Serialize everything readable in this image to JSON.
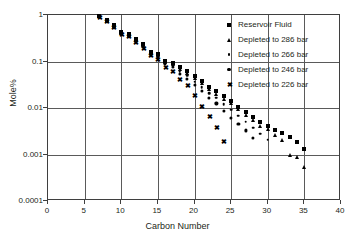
{
  "chart_data": {
    "type": "scatter",
    "title": "",
    "xlabel": "Carbon Number",
    "ylabel": "Mole%",
    "xlim": [
      0,
      40
    ],
    "ylim": [
      0.0001,
      1
    ],
    "yscale": "log",
    "grid": true,
    "legend_position": "top-right",
    "xticks": [
      "0",
      "5",
      "10",
      "15",
      "20",
      "25",
      "30",
      "35",
      "40"
    ],
    "xtick_values": [
      0,
      5,
      10,
      15,
      20,
      25,
      30,
      35,
      40
    ],
    "yticks": [
      "0.0001",
      "0.001",
      "0.01",
      "0.1",
      "1"
    ],
    "ytick_values": [
      0.0001,
      0.001,
      0.01,
      0.1,
      1
    ],
    "series": [
      {
        "name": "Reservoir Fluid",
        "marker": "square",
        "x": [
          7,
          8,
          9,
          10,
          11,
          12,
          13,
          14,
          15,
          16,
          17,
          18,
          19,
          20,
          21,
          22,
          23,
          24,
          25,
          26,
          27,
          28,
          29,
          30,
          31,
          32,
          33,
          34,
          35
        ],
        "y": [
          0.95,
          0.78,
          0.6,
          0.44,
          0.4,
          0.3,
          0.24,
          0.16,
          0.145,
          0.105,
          0.095,
          0.075,
          0.062,
          0.048,
          0.038,
          0.028,
          0.023,
          0.018,
          0.014,
          0.0105,
          0.0082,
          0.0063,
          0.005,
          0.0042,
          0.0034,
          0.0029,
          0.0024,
          0.0019,
          0.0013
        ]
      },
      {
        "name": "Depleted to 286 bar",
        "marker": "triangle",
        "x": [
          7,
          8,
          9,
          10,
          11,
          12,
          13,
          14,
          15,
          16,
          17,
          18,
          19,
          20,
          21,
          22,
          23,
          24,
          25,
          26,
          27,
          28,
          29,
          30,
          31,
          32,
          33,
          34,
          35
        ],
        "y": [
          0.94,
          0.76,
          0.58,
          0.42,
          0.38,
          0.285,
          0.23,
          0.152,
          0.138,
          0.1,
          0.09,
          0.07,
          0.057,
          0.044,
          0.034,
          0.025,
          0.0205,
          0.0155,
          0.0125,
          0.0093,
          0.0072,
          0.0055,
          0.0042,
          0.0035,
          0.0026,
          0.0021,
          0.00098,
          0.00087,
          0.00053
        ]
      },
      {
        "name": "Depleted to 266 bar",
        "marker": "small-dot",
        "x": [
          7,
          8,
          9,
          10,
          11,
          12,
          13,
          14,
          15,
          16,
          17,
          18,
          19,
          20,
          21,
          22,
          23,
          24,
          25,
          26,
          27,
          28,
          29,
          30
        ],
        "y": [
          0.93,
          0.75,
          0.57,
          0.41,
          0.37,
          0.275,
          0.22,
          0.145,
          0.13,
          0.094,
          0.082,
          0.062,
          0.05,
          0.037,
          0.028,
          0.021,
          0.0165,
          0.0122,
          0.0092,
          0.0068,
          0.0051,
          0.0038,
          0.0028,
          0.0021
        ]
      },
      {
        "name": "Depleted to 246 bar",
        "marker": "dot",
        "x": [
          7,
          8,
          9,
          10,
          11,
          12,
          13,
          14,
          15,
          16,
          17,
          18,
          19,
          20,
          21,
          22,
          23,
          24,
          25,
          26,
          27,
          28
        ],
        "y": [
          0.92,
          0.74,
          0.56,
          0.4,
          0.36,
          0.27,
          0.21,
          0.14,
          0.125,
          0.088,
          0.075,
          0.055,
          0.043,
          0.031,
          0.023,
          0.0165,
          0.0125,
          0.0088,
          0.0062,
          0.0045,
          0.0033,
          0.0023
        ]
      },
      {
        "name": "Depleted to 226 bar",
        "marker": "cross",
        "x": [
          7,
          8,
          9,
          10,
          11,
          12,
          13,
          14,
          15,
          16,
          17,
          18,
          19,
          20,
          21,
          22,
          23,
          24
        ],
        "y": [
          0.91,
          0.73,
          0.55,
          0.39,
          0.35,
          0.26,
          0.2,
          0.135,
          0.115,
          0.078,
          0.063,
          0.043,
          0.031,
          0.019,
          0.0112,
          0.0068,
          0.0039,
          0.002
        ]
      }
    ]
  },
  "legend": {
    "items": [
      {
        "label": "Reservoir Fluid",
        "marker": "square"
      },
      {
        "label": "Depleted to 286 bar",
        "marker": "triangle"
      },
      {
        "label": "Depleted to 266 bar",
        "marker": "small-dot"
      },
      {
        "label": "Depleted to 246 bar",
        "marker": "dot"
      },
      {
        "label": "Depleted to 226 bar",
        "marker": "cross"
      }
    ]
  }
}
